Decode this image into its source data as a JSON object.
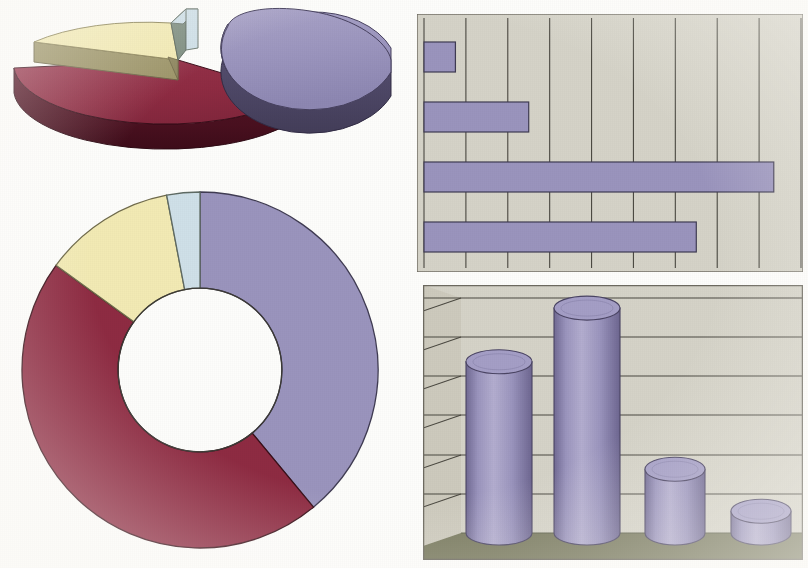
{
  "page": {
    "background_color": "#fdfdfb"
  },
  "palette": {
    "purple_top": "#9a94bd",
    "purple_side": "#4d4766",
    "purple_light": "#aaa4c9",
    "purple_dark": "#6f6893",
    "crimson_top": "#8e2b42",
    "crimson_side": "#49101f",
    "yellow_top": "#f2eab4",
    "yellow_side": "#9d9569",
    "blue_top": "#cfe0e8",
    "blue_side": "#7f8f82",
    "plot_bg": "#d5d3c8",
    "plot_bg_dark": "#c7c4b7",
    "floor": "#797a5f",
    "wall": "#d2cfc2",
    "gridline": "#4a4840",
    "outline": "#3a3832"
  },
  "chart_data": [
    {
      "id": "exploded-pie-3d",
      "type": "pie",
      "title": "",
      "exploded": true,
      "three_d": true,
      "start_angle_deg": 0,
      "labels": [
        "Series A",
        "Series B",
        "Series C",
        "Series D"
      ],
      "values": [
        38,
        45,
        13,
        4
      ],
      "colors": [
        "#9a94bd",
        "#8e2b42",
        "#f2eab4",
        "#cfe0e8"
      ],
      "exploded_slices": [
        0
      ],
      "legend": "none"
    },
    {
      "id": "doughnut",
      "type": "pie",
      "title": "",
      "doughnut": true,
      "hole_ratio": 0.46,
      "start_angle_deg": 0,
      "labels": [
        "Series A",
        "Series B",
        "Series C",
        "Series D"
      ],
      "values": [
        39,
        46,
        12,
        3
      ],
      "colors": [
        "#9a94bd",
        "#8e2b42",
        "#f2eab4",
        "#cfe0e8"
      ],
      "legend": "none"
    },
    {
      "id": "horizontal-bar",
      "type": "bar",
      "orientation": "horizontal",
      "title": "",
      "xlabel": "",
      "ylabel": "",
      "categories": [
        "Category 1",
        "Category 2",
        "Category 3",
        "Category 4"
      ],
      "values": [
        0.75,
        2.5,
        8.35,
        6.5
      ],
      "xlim": [
        0,
        9
      ],
      "gridlines": 9,
      "grid": true,
      "bar_color": "#9a94bd",
      "plot_background": "#d5d3c8",
      "legend": "none"
    },
    {
      "id": "cylinder-column-3d",
      "type": "bar",
      "orientation": "vertical",
      "three_d": true,
      "shape": "cylinder",
      "title": "",
      "xlabel": "",
      "ylabel": "",
      "categories": [
        "Category 1",
        "Category 2",
        "Category 3",
        "Category 4"
      ],
      "values": [
        5.1,
        6.7,
        1.9,
        0.65
      ],
      "ylim": [
        0,
        7
      ],
      "gridlines": 6,
      "grid": true,
      "bar_color": "#9a94bd",
      "plot_background": "#d5d3c8",
      "floor_color": "#797a5f",
      "legend": "none"
    }
  ]
}
